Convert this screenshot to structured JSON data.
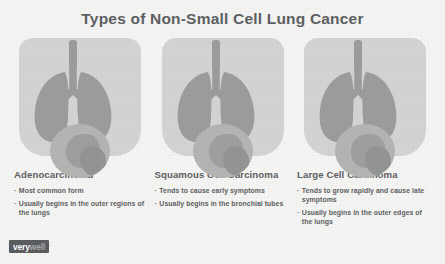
{
  "title": "Types of Non-Small Cell Lung Cancer",
  "panels": [
    {
      "heading": "Adenocarcinoma",
      "bullet_marker": "·",
      "bullets": [
        "Most common form",
        "Usually begins in the outer regions of the lungs"
      ],
      "illustration": "lungs-with-tumor-magnifier"
    },
    {
      "heading": "Squamous Cell Carcinoma",
      "bullet_marker": "·",
      "bullets": [
        "Tends to cause early symptoms",
        "Usually begins in the bronchial tubes"
      ],
      "illustration": "lungs-with-tumor-magnifier"
    },
    {
      "heading": "Large Cell Carcinoma",
      "bullet_marker": "·",
      "bullets": [
        "Tends to grow rapidly and cause late symptoms",
        "Usually begins in the outer edges of the lungs"
      ],
      "illustration": "lungs-with-tumor-magnifier"
    }
  ],
  "logo": {
    "part_one": "very",
    "part_two": "well"
  },
  "colors": {
    "background": "#f4f4f2",
    "text": "#5d5f63",
    "torso": "#d3d4d2",
    "lung": "#9b9d9a",
    "magnifier": "#b4b5b3",
    "logo_badge": "#5a5c60"
  }
}
